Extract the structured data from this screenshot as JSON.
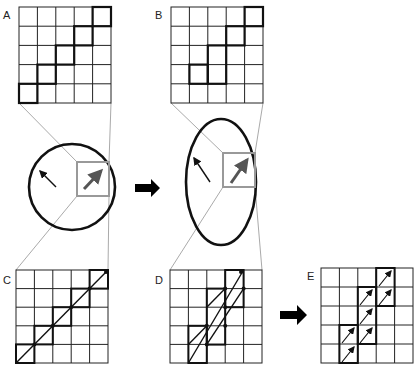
{
  "figure": {
    "panels": [
      {
        "id": "A",
        "label": "A",
        "description": "5x5 grid of pixels, stepped diagonal outline"
      },
      {
        "id": "B",
        "label": "B",
        "description": "5x5 grid of pixels, steeper stepped outline after stretching"
      },
      {
        "id": "C",
        "label": "C",
        "description": "5x5 grid with a single 45-degree line and dots at cell corners"
      },
      {
        "id": "D",
        "label": "D",
        "description": "5x5 grid with parallel diagonal segments in stretched stair cells"
      },
      {
        "id": "E",
        "label": "E",
        "description": "5x5 grid with short steep arrows inside stair cells"
      }
    ],
    "shapes": {
      "circle": {
        "label": "",
        "description": "circle with two arrows and gray zoom box"
      },
      "ellipse": {
        "label": "",
        "description": "vertically stretched ellipse with two arrows and gray zoom box"
      }
    },
    "arrows": [
      {
        "id": "arrow-circle-to-ellipse",
        "direction": "right"
      },
      {
        "id": "arrow-d-to-e",
        "direction": "right"
      }
    ],
    "colors": {
      "grid": "#222222",
      "zoom_box": "#999999",
      "connector": "#aaaaaa",
      "shape_stroke": "#111111",
      "arrow_fill": "#000000",
      "big_vector": "#555555"
    }
  }
}
